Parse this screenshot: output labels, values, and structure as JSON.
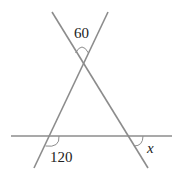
{
  "diagram": {
    "type": "geometry-angles",
    "line_color": "#8c8c8c",
    "text_color": "#222222",
    "labels": {
      "top_angle": "60",
      "bottom_left_angle": "120",
      "unknown_angle": "x"
    },
    "lines": [
      {
        "name": "line-descending",
        "x1": 52,
        "y1": 12,
        "x2": 148,
        "y2": 168
      },
      {
        "name": "line-ascending",
        "x1": 108,
        "y1": 12,
        "x2": 34,
        "y2": 168
      },
      {
        "name": "line-horizontal",
        "x1": 11,
        "y1": 136,
        "x2": 172,
        "y2": 136
      }
    ],
    "points": {
      "apex": {
        "x": 82,
        "y": 65
      },
      "left_intersection": {
        "x": 49,
        "y": 136
      },
      "right_intersection": {
        "x": 128,
        "y": 136
      }
    }
  }
}
